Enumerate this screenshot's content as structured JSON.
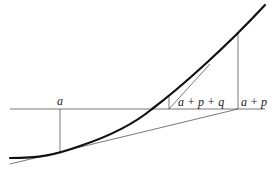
{
  "diagram": {
    "labels": {
      "a": "a",
      "a_p_q": "a + p + q",
      "a_p": "a + p"
    },
    "colors": {
      "curve": "#111111",
      "line": "#555555",
      "background": "#ffffff"
    }
  }
}
